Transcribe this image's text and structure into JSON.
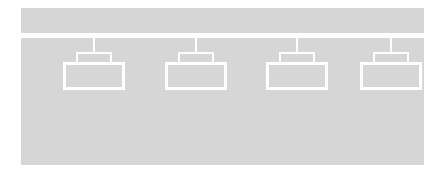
{
  "diagram": {
    "canvas": {
      "width": 442,
      "height": 174,
      "background_color": "#ffffff"
    },
    "colors": {
      "panel_fill": "#d6d6d6",
      "outline": "#ffffff",
      "background": "#ffffff"
    },
    "header_bar": {
      "name": "header-bar",
      "label": "",
      "x": 21,
      "y": 8,
      "width": 403,
      "height": 25,
      "fill": "#d6d6d6"
    },
    "main_panel": {
      "name": "main-panel",
      "label": "",
      "x": 21,
      "y": 38,
      "width": 403,
      "height": 127,
      "fill": "#d6d6d6"
    },
    "nodes": [
      {
        "id": "node-1",
        "label": "",
        "x": 25,
        "connector_label": "",
        "body_label": ""
      },
      {
        "id": "node-2",
        "label": "",
        "x": 127,
        "connector_label": "",
        "body_label": ""
      },
      {
        "id": "node-3",
        "label": "",
        "x": 228,
        "connector_label": "",
        "body_label": ""
      },
      {
        "id": "node-4",
        "label": "",
        "x": 322,
        "connector_label": ""
      }
    ]
  }
}
